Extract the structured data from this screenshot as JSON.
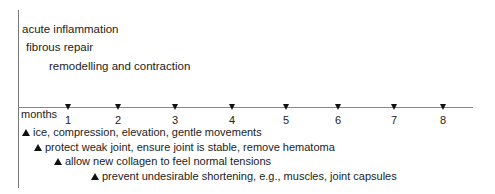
{
  "phases": [
    {
      "label": "acute inflammation",
      "x": 22,
      "y": 23
    },
    {
      "label": "fibrous repair",
      "x": 26,
      "y": 41
    },
    {
      "label": "remodelling and contraction",
      "x": 49,
      "y": 60
    }
  ],
  "axis": {
    "label": "months",
    "ticks": [
      {
        "label": "1",
        "x": 68
      },
      {
        "label": "2",
        "x": 118
      },
      {
        "label": "3",
        "x": 175
      },
      {
        "label": "4",
        "x": 232
      },
      {
        "label": "5",
        "x": 286
      },
      {
        "label": "6",
        "x": 338
      },
      {
        "label": "7",
        "x": 394
      },
      {
        "label": "8",
        "x": 443
      }
    ]
  },
  "actions": [
    {
      "label": "ice, compression, elevation, gentle movements",
      "x": 22,
      "y": 126
    },
    {
      "label": "protect weak joint, ensure joint is stable, remove hematoma",
      "x": 34,
      "y": 141
    },
    {
      "label": "allow new collagen to feel normal tensions",
      "x": 54,
      "y": 155
    },
    {
      "label": "prevent undesirable shortening, e.g., muscles, joint capsules",
      "x": 91,
      "y": 170
    }
  ]
}
